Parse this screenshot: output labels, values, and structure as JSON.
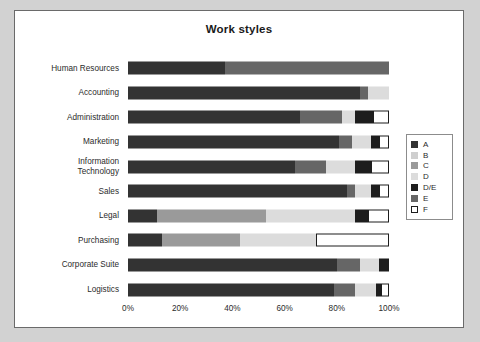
{
  "chart_data": {
    "type": "bar",
    "orientation": "horizontal",
    "stacked": true,
    "normalized_percent": true,
    "title": "Work styles",
    "xlabel": "",
    "ylabel": "",
    "xlim": [
      0,
      100
    ],
    "grid": false,
    "legend_position": "right",
    "x_ticks": [
      "0%",
      "20%",
      "40%",
      "60%",
      "80%",
      "100%"
    ],
    "x_tick_values": [
      0,
      20,
      40,
      60,
      80,
      100
    ],
    "categories": [
      "Human Resources",
      "Accounting",
      "Administration",
      "Marketing",
      "Information\nTechnology",
      "Sales",
      "Legal",
      "Purchasing",
      "Corporate Suite",
      "Logistics"
    ],
    "series": [
      {
        "name": "A",
        "color": "#333333",
        "values": [
          37,
          89,
          66,
          81,
          64,
          84,
          11,
          13,
          80,
          79
        ]
      },
      {
        "name": "B",
        "color": "#cfcfcf",
        "values": [
          0,
          0,
          0,
          0,
          0,
          0,
          0,
          0,
          0,
          0
        ]
      },
      {
        "name": "C",
        "color": "#9a9a9a",
        "values": [
          0,
          0,
          0,
          0,
          0,
          0,
          42,
          30,
          0,
          0
        ]
      },
      {
        "name": "D",
        "color": "#dcdcdc",
        "values": [
          0,
          8,
          5,
          7,
          11,
          6,
          34,
          29,
          7,
          8
        ]
      },
      {
        "name": "D/E",
        "color": "#1d1d1d",
        "values": [
          0,
          0,
          7,
          3,
          6,
          3,
          5,
          0,
          4,
          2
        ]
      },
      {
        "name": "E",
        "color": "#666666",
        "values": [
          63,
          3,
          16,
          5,
          12,
          3,
          0,
          0,
          9,
          8
        ]
      },
      {
        "name": "F",
        "color": "#ffffff",
        "values": [
          0,
          0,
          6,
          4,
          7,
          4,
          8,
          28,
          0,
          3
        ]
      }
    ],
    "stack_order": [
      "A",
      "C",
      "E",
      "D",
      "D/E",
      "F"
    ],
    "stacks": [
      {
        "category": "Human Resources",
        "segments": [
          {
            "name": "A",
            "value": 37
          },
          {
            "name": "E",
            "value": 63
          }
        ]
      },
      {
        "category": "Accounting",
        "segments": [
          {
            "name": "A",
            "value": 89
          },
          {
            "name": "E",
            "value": 3
          },
          {
            "name": "D",
            "value": 8
          }
        ]
      },
      {
        "category": "Administration",
        "segments": [
          {
            "name": "A",
            "value": 66
          },
          {
            "name": "E",
            "value": 16
          },
          {
            "name": "D",
            "value": 5
          },
          {
            "name": "D/E",
            "value": 7
          },
          {
            "name": "F",
            "value": 6
          }
        ]
      },
      {
        "category": "Marketing",
        "segments": [
          {
            "name": "A",
            "value": 81
          },
          {
            "name": "E",
            "value": 5
          },
          {
            "name": "D",
            "value": 7
          },
          {
            "name": "D/E",
            "value": 3
          },
          {
            "name": "F",
            "value": 4
          }
        ]
      },
      {
        "category": "Information\nTechnology",
        "segments": [
          {
            "name": "A",
            "value": 64
          },
          {
            "name": "E",
            "value": 12
          },
          {
            "name": "D",
            "value": 11
          },
          {
            "name": "D/E",
            "value": 6
          },
          {
            "name": "F",
            "value": 7
          }
        ]
      },
      {
        "category": "Sales",
        "segments": [
          {
            "name": "A",
            "value": 84
          },
          {
            "name": "E",
            "value": 3
          },
          {
            "name": "D",
            "value": 6
          },
          {
            "name": "D/E",
            "value": 3
          },
          {
            "name": "F",
            "value": 4
          }
        ]
      },
      {
        "category": "Legal",
        "segments": [
          {
            "name": "A",
            "value": 11
          },
          {
            "name": "C",
            "value": 42
          },
          {
            "name": "D",
            "value": 34
          },
          {
            "name": "D/E",
            "value": 5
          },
          {
            "name": "F",
            "value": 8
          }
        ]
      },
      {
        "category": "Purchasing",
        "segments": [
          {
            "name": "A",
            "value": 13
          },
          {
            "name": "C",
            "value": 30
          },
          {
            "name": "D",
            "value": 29
          },
          {
            "name": "F",
            "value": 28
          }
        ]
      },
      {
        "category": "Corporate Suite",
        "segments": [
          {
            "name": "A",
            "value": 80
          },
          {
            "name": "E",
            "value": 9
          },
          {
            "name": "D",
            "value": 7
          },
          {
            "name": "D/E",
            "value": 4
          }
        ]
      },
      {
        "category": "Logistics",
        "segments": [
          {
            "name": "A",
            "value": 79
          },
          {
            "name": "E",
            "value": 8
          },
          {
            "name": "D",
            "value": 8
          },
          {
            "name": "D/E",
            "value": 2
          },
          {
            "name": "F",
            "value": 3
          }
        ]
      }
    ],
    "legend": [
      {
        "label": "A",
        "color": "#333333"
      },
      {
        "label": "B",
        "color": "#cfcfcf"
      },
      {
        "label": "C",
        "color": "#9a9a9a"
      },
      {
        "label": "D",
        "color": "#dcdcdc"
      },
      {
        "label": "D/E",
        "color": "#1d1d1d"
      },
      {
        "label": "E",
        "color": "#666666"
      },
      {
        "label": "F",
        "color": "#ffffff"
      }
    ]
  },
  "page": {
    "background_color": "#d2d2d2",
    "panel_background_color": "#ffffff",
    "panel_border_color": "#6a6a6a"
  }
}
